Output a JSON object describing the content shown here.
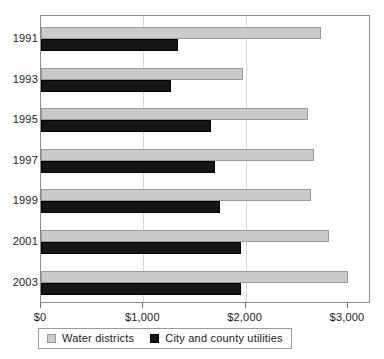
{
  "chart_data": {
    "type": "bar",
    "orientation": "horizontal",
    "title": "",
    "subtitle": "",
    "xlabel": "",
    "ylabel": "",
    "categories": [
      "1991",
      "1993",
      "1995",
      "1997",
      "1999",
      "2001",
      "2003"
    ],
    "series": [
      {
        "name": "Water districts",
        "color": "#cbcbcb",
        "values": [
          2740,
          1975,
          2610,
          2670,
          2640,
          2810,
          3000
        ]
      },
      {
        "name": "City and county utilities",
        "color": "#151515",
        "values": [
          1340,
          1270,
          1660,
          1700,
          1750,
          1950,
          1950
        ]
      }
    ],
    "xlim": [
      0,
      3000
    ],
    "xticks": [
      0,
      1000,
      2000,
      3000
    ],
    "xticklabels": [
      "$0",
      "$1,000",
      "$2,000",
      "$3,000"
    ],
    "gridlines": [
      1000,
      2000
    ],
    "grid": true,
    "legend_position": "bottom",
    "legend_entries": [
      "Water districts",
      "City and county utilities"
    ]
  }
}
